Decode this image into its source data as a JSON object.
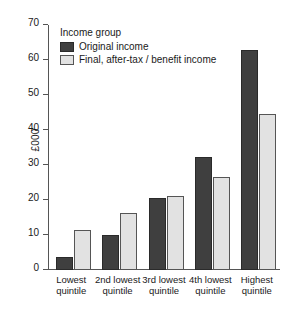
{
  "chart_data": {
    "type": "bar",
    "title": "",
    "xlabel": "",
    "ylabel": "£000",
    "ylim": [
      0,
      70
    ],
    "yticks": [
      0,
      10,
      20,
      30,
      40,
      50,
      60,
      70
    ],
    "grid": false,
    "legend_position": "top-left",
    "legend_title": "Income group",
    "categories": [
      "Lowest quintile",
      "2nd lowest quintile",
      "3rd lowest quintile",
      "4th lowest quintile",
      "Highest quintile"
    ],
    "category_lines": [
      [
        "Lowest",
        "quintile"
      ],
      [
        "2nd lowest",
        "quintile"
      ],
      [
        "3rd lowest",
        "quintile"
      ],
      [
        "4th lowest",
        "quintile"
      ],
      [
        "Highest",
        "quintile"
      ]
    ],
    "series": [
      {
        "name": "Original income",
        "color": "#3f3f3f",
        "values": [
          3.7,
          10.1,
          20.5,
          32.3,
          62.8
        ]
      },
      {
        "name": "Final, after-tax / benefit income",
        "color": "#e2e2e2",
        "values": [
          11.5,
          16.3,
          21.2,
          26.5,
          44.5
        ]
      }
    ]
  },
  "colors": {
    "original_income": "#3f3f3f",
    "final_income": "#e2e2e2",
    "axis": "#555555",
    "text": "#1a1a1a",
    "background": "#ffffff"
  }
}
